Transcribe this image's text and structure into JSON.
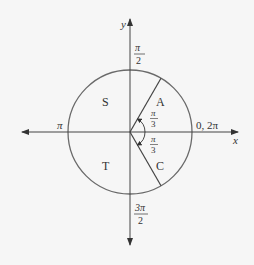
{
  "axes": {
    "x_label": "x",
    "y_label": "y"
  },
  "angle_labels": {
    "top_num": "π",
    "top_den": "2",
    "left": "π",
    "right": "0, 2π",
    "bottom_num": "3π",
    "bottom_den": "2"
  },
  "quadrants": {
    "q1": "A",
    "q2": "S",
    "q3": "T",
    "q4": "C"
  },
  "reference_angles": {
    "upper_num": "π",
    "upper_den": "3",
    "lower_num": "π",
    "lower_den": "3"
  },
  "colors": {
    "stroke": "#555555",
    "circle": "#6a6a6a",
    "text": "#333333",
    "background": "#f6f6f6"
  }
}
